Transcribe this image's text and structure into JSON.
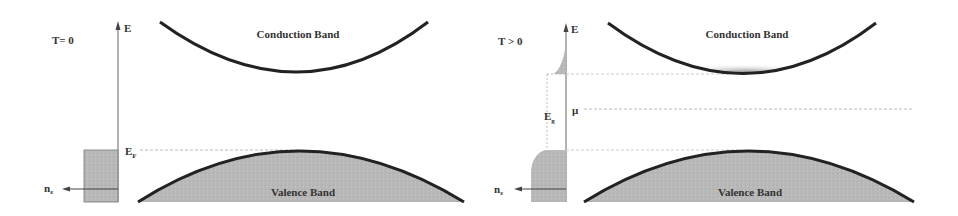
{
  "left_panel": {
    "temperature_label": "T= 0",
    "energy_axis_label": "E",
    "fermi_label": "E",
    "fermi_sub": "F",
    "density_label": "n",
    "density_sub": "ε",
    "conduction_label": "Conduction Band",
    "valence_label": "Valence Band"
  },
  "right_panel": {
    "temperature_label": "T > 0",
    "energy_axis_label": "E",
    "gap_label": "E",
    "gap_sub": "g",
    "chemical_potential_label": "μ",
    "density_label": "n",
    "density_sub": "ε",
    "conduction_label": "Conduction Band",
    "valence_label": "Valence Band"
  },
  "colors": {
    "curve": "#222222",
    "fill": "#b8b8b8",
    "axis": "#666666",
    "dotted": "#bbbbbb"
  }
}
